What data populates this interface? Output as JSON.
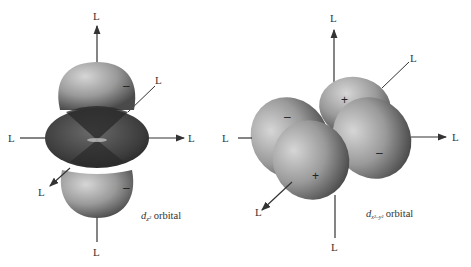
{
  "ligand_label": "L",
  "diagrams": [
    {
      "id": "dz2",
      "caption_main": "d",
      "caption_sub": "z²",
      "caption_rest": " orbital",
      "signs": {
        "top_lobe": "–",
        "torus": "–",
        "bottom_lobe": "–"
      }
    },
    {
      "id": "dx2-y2",
      "caption_main": "d",
      "caption_sub": "x²–y²",
      "caption_rest": " orbital",
      "signs": {
        "back_right": "+",
        "back_left": "–",
        "front_left": "+",
        "front_right": "–"
      }
    }
  ],
  "colors": {
    "lobe_light": "#c9c9c9",
    "lobe_mid": "#8a8a8a",
    "lobe_dark": "#3a3a3a",
    "axis": "#333333"
  }
}
